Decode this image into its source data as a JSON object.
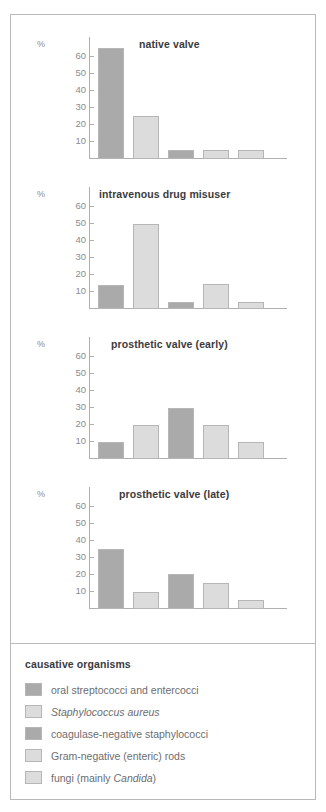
{
  "figure": {
    "y_axis_unit": "%",
    "y_ticks": [
      10,
      20,
      30,
      40,
      50,
      60
    ],
    "y_max": 68
  },
  "legend": {
    "title": "causative organisms",
    "items": [
      {
        "label": "oral streptococci and entercocci",
        "color": "#aaaaaa",
        "italic": false
      },
      {
        "label": "Staphylococcus aureus",
        "color": "#dcdcdc",
        "italic": true
      },
      {
        "label": "coagulase-negative staphylococci",
        "color": "#aaaaaa",
        "italic": false
      },
      {
        "label": "Gram-negative (enteric) rods",
        "color": "#dcdcdc",
        "italic": false
      },
      {
        "label_pre": "fungi (mainly ",
        "label_it": "Candida",
        "label_post": ")",
        "color": "#dcdcdc",
        "italic": false
      }
    ]
  },
  "chart_data": [
    {
      "type": "bar",
      "title": "native valve",
      "xlabel": "",
      "ylabel": "%",
      "ylim": [
        0,
        68
      ],
      "yticks": [
        10,
        20,
        30,
        40,
        50,
        60
      ],
      "grid": false,
      "legend_position": "external-below",
      "categories": [
        "oral streptococci and entercocci",
        "Staphylococcus aureus",
        "coagulase-negative staphylococci",
        "Gram-negative (enteric) rods",
        "fungi (mainly Candida)"
      ],
      "values": [
        65,
        25,
        5,
        5,
        5
      ],
      "colors": [
        "#aaaaaa",
        "#dcdcdc",
        "#aaaaaa",
        "#dcdcdc",
        "#dcdcdc"
      ]
    },
    {
      "type": "bar",
      "title": "intravenous drug misuser",
      "xlabel": "",
      "ylabel": "%",
      "ylim": [
        0,
        68
      ],
      "yticks": [
        10,
        20,
        30,
        40,
        50,
        60
      ],
      "grid": false,
      "legend_position": "external-below",
      "categories": [
        "oral streptococci and entercocci",
        "Staphylococcus aureus",
        "coagulase-negative staphylococci",
        "Gram-negative (enteric) rods",
        "fungi (mainly Candida)"
      ],
      "values": [
        14,
        50,
        4,
        14.5,
        4
      ],
      "colors": [
        "#aaaaaa",
        "#dcdcdc",
        "#aaaaaa",
        "#dcdcdc",
        "#dcdcdc"
      ]
    },
    {
      "type": "bar",
      "title": "prosthetic valve (early)",
      "xlabel": "",
      "ylabel": "%",
      "ylim": [
        0,
        68
      ],
      "yticks": [
        10,
        20,
        30,
        40,
        50,
        60
      ],
      "grid": false,
      "legend_position": "external-below",
      "categories": [
        "oral streptococci and entercocci",
        "Staphylococcus aureus",
        "coagulase-negative staphylococci",
        "Gram-negative (enteric) rods",
        "fungi (mainly Candida)"
      ],
      "values": [
        10,
        20,
        30,
        20,
        10
      ],
      "colors": [
        "#aaaaaa",
        "#dcdcdc",
        "#aaaaaa",
        "#dcdcdc",
        "#dcdcdc"
      ]
    },
    {
      "type": "bar",
      "title": "prosthetic valve (late)",
      "xlabel": "",
      "ylabel": "%",
      "ylim": [
        0,
        68
      ],
      "yticks": [
        10,
        20,
        30,
        40,
        50,
        60
      ],
      "grid": false,
      "legend_position": "external-below",
      "categories": [
        "oral streptococci and entercocci",
        "Staphylococcus aureus",
        "coagulase-negative staphylococci",
        "Gram-negative (enteric) rods",
        "fungi (mainly Candida)"
      ],
      "values": [
        35,
        10,
        20.5,
        15.5,
        5
      ],
      "colors": [
        "#aaaaaa",
        "#dcdcdc",
        "#aaaaaa",
        "#dcdcdc",
        "#dcdcdc"
      ]
    }
  ]
}
